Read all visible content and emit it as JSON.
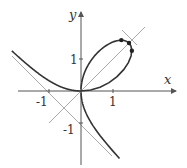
{
  "diagram": {
    "title": "",
    "equation": "x^3 + y^3 = 3xy",
    "axes": {
      "x_label": "x",
      "y_label": "y",
      "x_ticks": [
        {
          "value": -1,
          "label": "-1"
        },
        {
          "value": 1,
          "label": "1"
        }
      ],
      "y_ticks": [
        {
          "value": 1,
          "label": "1"
        },
        {
          "value": -1,
          "label": "-1"
        }
      ]
    },
    "lines": [
      {
        "name": "asymptote",
        "equation": "x + y = -1",
        "color": "#aaaaaa"
      },
      {
        "name": "symmetry-line",
        "equation": "y = x",
        "color": "#aaaaaa"
      },
      {
        "name": "tangent-at-vertex",
        "equation": "x + y = 3",
        "color": "#aaaaaa"
      }
    ],
    "points": [
      {
        "name": "vertex",
        "x": 1.5,
        "y": 1.5
      },
      {
        "name": "max-y-point",
        "x": 1.26,
        "y": 1.59
      },
      {
        "name": "max-x-point",
        "x": 1.59,
        "y": 1.26
      }
    ],
    "colors": {
      "curve": "#333333",
      "axes": "#555555",
      "guides": "#aaaaaa"
    }
  }
}
